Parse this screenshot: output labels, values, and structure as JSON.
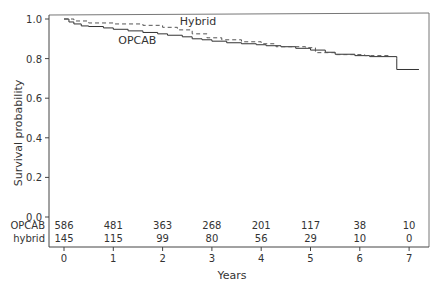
{
  "chart_data": {
    "type": "line",
    "subtype": "kaplan-meier",
    "title": "",
    "xlabel": "Years",
    "ylabel": "Survival probability",
    "xlim": [
      0,
      7
    ],
    "ylim": [
      0,
      1.0
    ],
    "x_ticks": [
      0,
      1,
      2,
      3,
      4,
      5,
      6,
      7
    ],
    "y_ticks": [
      "0.0",
      "0.2",
      "0.4",
      "0.6",
      "0.8",
      "1.0"
    ],
    "grid": false,
    "legend": "inline labels",
    "series": [
      {
        "name": "OPCAB",
        "style": "solid",
        "label_pos": [
          1.1,
          0.875
        ],
        "points": [
          [
            0,
            1.0
          ],
          [
            0.1,
            0.985
          ],
          [
            0.2,
            0.975
          ],
          [
            0.35,
            0.965
          ],
          [
            0.5,
            0.962
          ],
          [
            0.8,
            0.955
          ],
          [
            1.0,
            0.948
          ],
          [
            1.3,
            0.94
          ],
          [
            1.6,
            0.932
          ],
          [
            1.9,
            0.925
          ],
          [
            2.1,
            0.918
          ],
          [
            2.4,
            0.91
          ],
          [
            2.6,
            0.9
          ],
          [
            2.8,
            0.895
          ],
          [
            3.0,
            0.888
          ],
          [
            3.3,
            0.88
          ],
          [
            3.6,
            0.875
          ],
          [
            3.9,
            0.87
          ],
          [
            4.1,
            0.865
          ],
          [
            4.4,
            0.86
          ],
          [
            4.7,
            0.852
          ],
          [
            5.0,
            0.843
          ],
          [
            5.3,
            0.832
          ],
          [
            5.5,
            0.822
          ],
          [
            5.9,
            0.815
          ],
          [
            6.2,
            0.81
          ],
          [
            6.75,
            0.8
          ],
          [
            6.75,
            0.745
          ],
          [
            7.2,
            0.745
          ]
        ]
      },
      {
        "name": "Hybrid",
        "style": "dashed",
        "label_pos": [
          2.35,
          0.972
        ],
        "points": [
          [
            0,
            1.0
          ],
          [
            0.2,
            0.99
          ],
          [
            0.5,
            0.98
          ],
          [
            1.0,
            0.975
          ],
          [
            1.6,
            0.968
          ],
          [
            2.0,
            0.958
          ],
          [
            2.3,
            0.945
          ],
          [
            2.6,
            0.925
          ],
          [
            2.9,
            0.905
          ],
          [
            3.2,
            0.895
          ],
          [
            3.6,
            0.885
          ],
          [
            4.0,
            0.875
          ],
          [
            4.3,
            0.86
          ],
          [
            4.9,
            0.855
          ],
          [
            5.1,
            0.83
          ],
          [
            5.5,
            0.82
          ],
          [
            6.1,
            0.815
          ],
          [
            6.6,
            0.815
          ]
        ]
      }
    ],
    "at_risk_table": {
      "rows": [
        {
          "label": "OPCAB",
          "values": [
            586,
            481,
            363,
            268,
            201,
            117,
            38,
            10
          ]
        },
        {
          "label": "hybrid",
          "values": [
            145,
            115,
            99,
            80,
            56,
            29,
            10,
            0
          ]
        }
      ]
    }
  }
}
